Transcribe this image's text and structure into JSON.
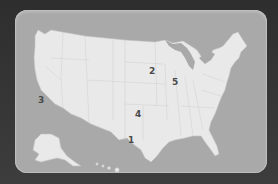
{
  "map": {
    "title": "United States",
    "colors": {
      "background": "#3a3a3a",
      "water": "#a9a9a9",
      "land": "#e9e9e9",
      "label": "#4a4a4a"
    },
    "markers": [
      {
        "id": "1",
        "label": "1",
        "x": 131,
        "y": 140
      },
      {
        "id": "2",
        "label": "2",
        "x": 152,
        "y": 71
      },
      {
        "id": "3",
        "label": "3",
        "x": 41,
        "y": 100
      },
      {
        "id": "4",
        "label": "4",
        "x": 138,
        "y": 114
      },
      {
        "id": "5",
        "label": "5",
        "x": 175,
        "y": 82
      }
    ]
  }
}
